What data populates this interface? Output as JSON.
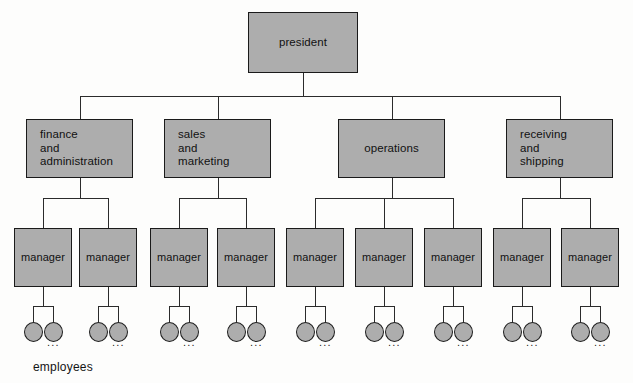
{
  "diagram": {
    "caption": "employees",
    "ellipsis": "...",
    "colors": {
      "node_fill": "#adadad",
      "node_border": "#1a1a1a",
      "connector": "#2b2b2b",
      "background": "#fdfdfc",
      "text": "#111111"
    },
    "levels": {
      "level1_label": "president",
      "level2_label": "departments",
      "level3_label": "managers",
      "level4_label": "employees"
    }
  },
  "root": {
    "label": "president",
    "x": 248,
    "y": 12,
    "w": 110,
    "h": 61
  },
  "departments": [
    {
      "id": "finance-and-administration",
      "label": "finance\nand\nadministration",
      "align": "left",
      "x": 26,
      "y": 119,
      "w": 107,
      "h": 59,
      "managers": 2
    },
    {
      "id": "sales-and-marketing",
      "label": "sales\nand\nmarketing",
      "align": "left",
      "x": 164,
      "y": 119,
      "w": 107,
      "h": 59,
      "managers": 2
    },
    {
      "id": "operations",
      "label": "operations",
      "align": "center",
      "x": 338,
      "y": 119,
      "w": 107,
      "h": 59,
      "managers": 3
    },
    {
      "id": "receiving-and-shipping",
      "label": "receiving\nand\nshipping",
      "align": "left",
      "x": 506,
      "y": 119,
      "w": 107,
      "h": 59,
      "managers": 2
    }
  ],
  "managers": [
    {
      "label": "manager",
      "x": 14,
      "y": 228,
      "w": 58,
      "h": 59,
      "dept": "finance-and-administration"
    },
    {
      "label": "manager",
      "x": 79,
      "y": 228,
      "w": 58,
      "h": 59,
      "dept": "finance-and-administration"
    },
    {
      "label": "manager",
      "x": 150,
      "y": 228,
      "w": 58,
      "h": 59,
      "dept": "sales-and-marketing"
    },
    {
      "label": "manager",
      "x": 217,
      "y": 228,
      "w": 58,
      "h": 59,
      "dept": "sales-and-marketing"
    },
    {
      "label": "manager",
      "x": 286,
      "y": 228,
      "w": 58,
      "h": 59,
      "dept": "operations"
    },
    {
      "label": "manager",
      "x": 355,
      "y": 228,
      "w": 58,
      "h": 59,
      "dept": "operations"
    },
    {
      "label": "manager",
      "x": 424,
      "y": 228,
      "w": 58,
      "h": 59,
      "dept": "operations"
    },
    {
      "label": "manager",
      "x": 493,
      "y": 228,
      "w": 58,
      "h": 59,
      "dept": "receiving-and-shipping"
    },
    {
      "label": "manager",
      "x": 561,
      "y": 228,
      "w": 58,
      "h": 59,
      "dept": "receiving-and-shipping"
    }
  ],
  "employee_groups": [
    {
      "manager_index": 0,
      "count": 2,
      "ellipsis": "..."
    },
    {
      "manager_index": 1,
      "count": 2,
      "ellipsis": "..."
    },
    {
      "manager_index": 2,
      "count": 2,
      "ellipsis": "..."
    },
    {
      "manager_index": 3,
      "count": 2,
      "ellipsis": "..."
    },
    {
      "manager_index": 4,
      "count": 2,
      "ellipsis": "..."
    },
    {
      "manager_index": 5,
      "count": 2,
      "ellipsis": "..."
    },
    {
      "manager_index": 6,
      "count": 2,
      "ellipsis": "..."
    },
    {
      "manager_index": 7,
      "count": 2,
      "ellipsis": "..."
    },
    {
      "manager_index": 8,
      "count": 2,
      "ellipsis": "..."
    }
  ],
  "geometry": {
    "root_bus_y": 96,
    "dept_bus_y": 198,
    "emp_bus_y": 306,
    "emp_circle_y": 322,
    "emp_circle_d": 19,
    "emp_spread": 20,
    "caption_x": 33,
    "caption_y": 360
  }
}
